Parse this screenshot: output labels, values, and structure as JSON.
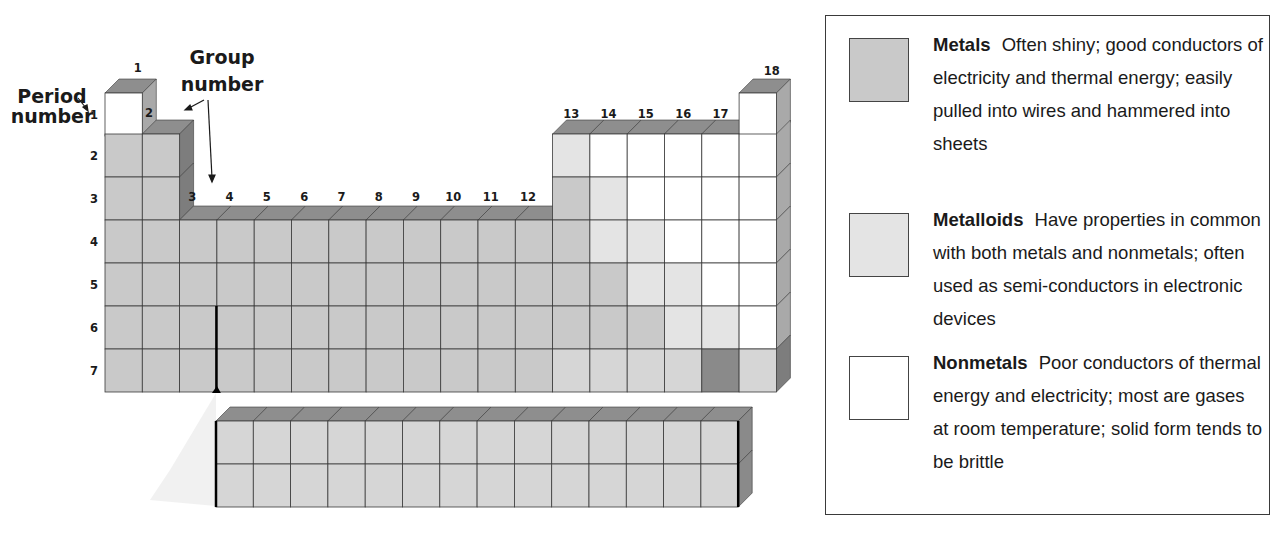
{
  "labels": {
    "period_number": [
      "Period",
      "number"
    ],
    "group_number": [
      "Group",
      "number"
    ]
  },
  "groups": [
    "1",
    "2",
    "3",
    "4",
    "5",
    "6",
    "7",
    "8",
    "9",
    "10",
    "11",
    "12",
    "13",
    "14",
    "15",
    "16",
    "17",
    "18"
  ],
  "periods": [
    "1",
    "2",
    "3",
    "4",
    "5",
    "6",
    "7"
  ],
  "colors": {
    "metal": "#c9c9c9",
    "metal_light": "#d6d6d6",
    "metalloid": "#e4e4e4",
    "nonmetal": "#ffffff",
    "unknown": "#8a8a8a",
    "top_face": "#8e8e8e",
    "side_face": "#a9a9a9",
    "line": "#3a3a3a"
  },
  "main_table": {
    "rows": [
      {
        "period": "1",
        "cells": [
          [
            1,
            "nonmetal"
          ],
          [
            18,
            "nonmetal"
          ]
        ]
      },
      {
        "period": "2",
        "cells": [
          [
            1,
            "metal"
          ],
          [
            2,
            "metal"
          ],
          [
            13,
            "metalloid"
          ],
          [
            14,
            "nonmetal"
          ],
          [
            15,
            "nonmetal"
          ],
          [
            16,
            "nonmetal"
          ],
          [
            17,
            "nonmetal"
          ],
          [
            18,
            "nonmetal"
          ]
        ]
      },
      {
        "period": "3",
        "cells": [
          [
            1,
            "metal"
          ],
          [
            2,
            "metal"
          ],
          [
            13,
            "metal"
          ],
          [
            14,
            "metalloid"
          ],
          [
            15,
            "nonmetal"
          ],
          [
            16,
            "nonmetal"
          ],
          [
            17,
            "nonmetal"
          ],
          [
            18,
            "nonmetal"
          ]
        ]
      },
      {
        "period": "4",
        "cells": [
          [
            1,
            "metal"
          ],
          [
            2,
            "metal"
          ],
          [
            3,
            "metal"
          ],
          [
            4,
            "metal"
          ],
          [
            5,
            "metal"
          ],
          [
            6,
            "metal"
          ],
          [
            7,
            "metal"
          ],
          [
            8,
            "metal"
          ],
          [
            9,
            "metal"
          ],
          [
            10,
            "metal"
          ],
          [
            11,
            "metal"
          ],
          [
            12,
            "metal"
          ],
          [
            13,
            "metal"
          ],
          [
            14,
            "metalloid"
          ],
          [
            15,
            "metalloid"
          ],
          [
            16,
            "nonmetal"
          ],
          [
            17,
            "nonmetal"
          ],
          [
            18,
            "nonmetal"
          ]
        ]
      },
      {
        "period": "5",
        "cells": [
          [
            1,
            "metal"
          ],
          [
            2,
            "metal"
          ],
          [
            3,
            "metal"
          ],
          [
            4,
            "metal"
          ],
          [
            5,
            "metal"
          ],
          [
            6,
            "metal"
          ],
          [
            7,
            "metal"
          ],
          [
            8,
            "metal"
          ],
          [
            9,
            "metal"
          ],
          [
            10,
            "metal"
          ],
          [
            11,
            "metal"
          ],
          [
            12,
            "metal"
          ],
          [
            13,
            "metal"
          ],
          [
            14,
            "metal"
          ],
          [
            15,
            "metalloid"
          ],
          [
            16,
            "metalloid"
          ],
          [
            17,
            "nonmetal"
          ],
          [
            18,
            "nonmetal"
          ]
        ]
      },
      {
        "period": "6",
        "cells": [
          [
            1,
            "metal"
          ],
          [
            2,
            "metal"
          ],
          [
            3,
            "metal"
          ],
          [
            4,
            "metal"
          ],
          [
            5,
            "metal"
          ],
          [
            6,
            "metal"
          ],
          [
            7,
            "metal"
          ],
          [
            8,
            "metal"
          ],
          [
            9,
            "metal"
          ],
          [
            10,
            "metal"
          ],
          [
            11,
            "metal"
          ],
          [
            12,
            "metal"
          ],
          [
            13,
            "metal"
          ],
          [
            14,
            "metal"
          ],
          [
            15,
            "metal"
          ],
          [
            16,
            "metalloid"
          ],
          [
            17,
            "metalloid"
          ],
          [
            18,
            "nonmetal"
          ]
        ]
      },
      {
        "period": "7",
        "cells": [
          [
            1,
            "metal"
          ],
          [
            2,
            "metal"
          ],
          [
            3,
            "metal"
          ],
          [
            4,
            "metal"
          ],
          [
            5,
            "metal"
          ],
          [
            6,
            "metal"
          ],
          [
            7,
            "metal"
          ],
          [
            8,
            "metal"
          ],
          [
            9,
            "metal"
          ],
          [
            10,
            "metal"
          ],
          [
            11,
            "metal"
          ],
          [
            12,
            "metal"
          ],
          [
            13,
            "metal_light"
          ],
          [
            14,
            "metal_light"
          ],
          [
            15,
            "metal_light"
          ],
          [
            16,
            "metal_light"
          ],
          [
            17,
            "unknown"
          ],
          [
            18,
            "metal_light"
          ]
        ]
      }
    ]
  },
  "inner_transition": {
    "columns": 14,
    "rows": 2,
    "type": "metal_light"
  },
  "legend": {
    "items": [
      {
        "title": "Metals",
        "text": "Often shiny; good conductors of electricity and thermal energy; easily pulled into wires and hammered into sheets",
        "swatch": "metal"
      },
      {
        "title": "Metalloids",
        "text": "Have properties in common with both metals and nonmetals; often used as semi-conductors in electronic devices",
        "swatch": "metalloid"
      },
      {
        "title": "Nonmetals",
        "text": "Poor conductors of thermal energy and electricity; most are gases at room temperature; solid form tends to be brittle",
        "swatch": "nonmetal"
      }
    ]
  }
}
